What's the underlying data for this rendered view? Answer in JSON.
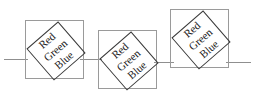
{
  "diagram": {
    "line_color": "#8f8f8f",
    "square_border_color": "#9a9a9a",
    "diamond_border_color": "#3a3a3a",
    "text_color": "#1a1a1a",
    "words": {
      "red": "Red",
      "green": "Green",
      "blue": "Blue"
    },
    "figures": [
      {
        "name": "figure-1",
        "x": 25,
        "y": 20,
        "size": 59,
        "rotation": -41,
        "words": [
          "Red",
          "Green",
          "Blue"
        ]
      },
      {
        "name": "figure-2",
        "x": 98,
        "y": 30,
        "size": 59,
        "rotation": -41,
        "words": [
          "Red",
          "Green",
          "Blue"
        ]
      },
      {
        "name": "figure-3",
        "x": 170,
        "y": 9,
        "size": 59,
        "rotation": -41,
        "words": [
          "Red",
          "Green",
          "Blue"
        ]
      }
    ],
    "connectors": [
      {
        "name": "connector-left",
        "x": 4,
        "y": 59,
        "width": 24
      },
      {
        "name": "connector-mid-1",
        "x": 80,
        "y": 59,
        "width": 22
      },
      {
        "name": "connector-mid-2",
        "x": 154,
        "y": 62,
        "width": 20
      },
      {
        "name": "connector-right",
        "x": 226,
        "y": 62,
        "width": 25
      }
    ]
  }
}
